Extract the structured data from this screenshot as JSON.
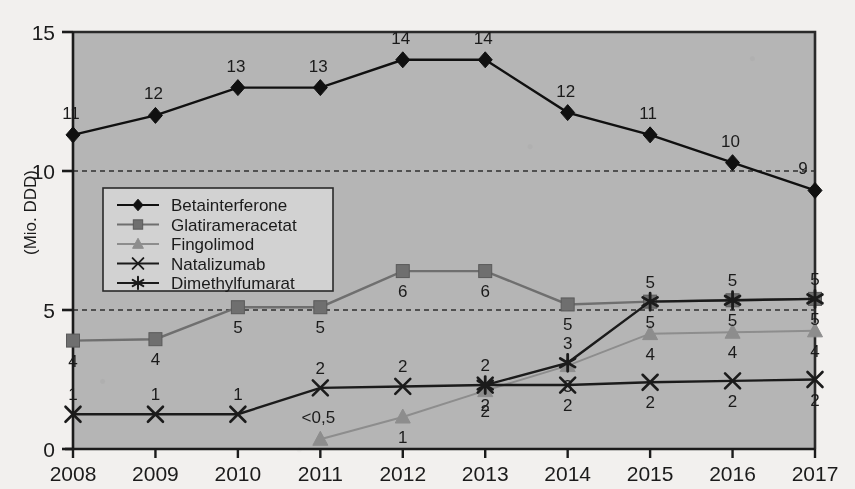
{
  "chart_data": {
    "type": "line",
    "title": "",
    "subtitle": "",
    "xlabel": "",
    "ylabel": "(Mio. DDD)",
    "categories": [
      "2008",
      "2009",
      "2010",
      "2011",
      "2012",
      "2013",
      "2014",
      "2015",
      "2016",
      "2017"
    ],
    "xlim": [
      2008,
      2017
    ],
    "ylim": [
      0,
      15
    ],
    "yticks": [
      "0",
      "5",
      "10",
      "15"
    ],
    "ytick_values": [
      0,
      5,
      10,
      15
    ],
    "grid": "dashed horizontal gridlines at 5 and 10",
    "legend_position": "inside upper-left",
    "plot_background": "#b5b5b5",
    "series": [
      {
        "name": "Betainterferone",
        "marker": "diamond",
        "color": "#101010",
        "values": [
          11.3,
          12.0,
          13.0,
          13.0,
          14.0,
          14.0,
          12.1,
          11.3,
          10.3,
          9.3
        ],
        "labels": [
          "11",
          "12",
          "13",
          "13",
          "14",
          "14",
          "12",
          "11",
          "10",
          "9"
        ],
        "label_pos": [
          "above",
          "above",
          "above",
          "above",
          "above",
          "above",
          "above",
          "above",
          "above",
          "above"
        ]
      },
      {
        "name": "Glatirameracetat",
        "marker": "square",
        "color": "#6f6f6f",
        "values": [
          3.9,
          3.95,
          5.1,
          5.1,
          6.4,
          6.4,
          5.2,
          5.3,
          5.35,
          5.4
        ],
        "labels": [
          "4",
          "4",
          "5",
          "5",
          "6",
          "6",
          "5",
          "5",
          "5",
          "5"
        ],
        "label_pos": [
          "below",
          "below",
          "below",
          "below",
          "below",
          "below",
          "below",
          "below",
          "below",
          "below"
        ]
      },
      {
        "name": "Fingolimod",
        "marker": "triangle",
        "color": "#8d8d8d",
        "values": [
          null,
          null,
          null,
          0.35,
          1.15,
          2.1,
          3.0,
          4.15,
          4.2,
          4.25
        ],
        "labels": [
          null,
          null,
          null,
          "<0,5",
          "1",
          "2",
          "3",
          "4",
          "4",
          "4"
        ],
        "label_pos": [
          null,
          null,
          null,
          "above",
          "below",
          "below",
          "below",
          "below",
          "below",
          "below"
        ]
      },
      {
        "name": "Natalizumab",
        "marker": "cross",
        "color": "#1b1b1b",
        "values": [
          1.25,
          1.25,
          1.25,
          2.2,
          2.25,
          2.3,
          2.3,
          2.4,
          2.45,
          2.5
        ],
        "labels": [
          "1",
          "1",
          "1",
          "2",
          "2",
          "2",
          "2",
          "2",
          "2",
          "2"
        ],
        "label_pos": [
          "above",
          "above",
          "above",
          "above",
          "above",
          "below",
          "below",
          "below",
          "below",
          "below"
        ]
      },
      {
        "name": "Dimethylfumarat",
        "marker": "asterisk",
        "color": "#1b1b1b",
        "values": [
          null,
          null,
          null,
          null,
          null,
          2.3,
          3.1,
          5.3,
          5.35,
          5.4
        ],
        "labels": [
          null,
          null,
          null,
          null,
          null,
          "2",
          "3",
          "5",
          "5",
          "5"
        ],
        "label_pos": [
          null,
          null,
          null,
          null,
          null,
          "above",
          "above",
          "above",
          "above",
          "above"
        ]
      }
    ]
  },
  "legend": {
    "items": [
      {
        "label": "Betainterferone",
        "marker": "diamond",
        "color": "#101010"
      },
      {
        "label": "Glatirameracetat",
        "marker": "square",
        "color": "#6f6f6f"
      },
      {
        "label": "Fingolimod",
        "marker": "triangle",
        "color": "#8d8d8d"
      },
      {
        "label": "Natalizumab",
        "marker": "cross",
        "color": "#1b1b1b"
      },
      {
        "label": "Dimethylfumarat",
        "marker": "asterisk",
        "color": "#1b1b1b"
      }
    ]
  }
}
